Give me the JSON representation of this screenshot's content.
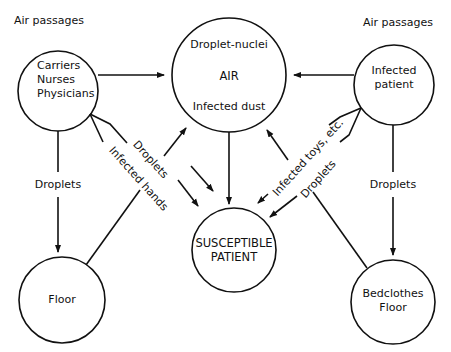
{
  "diagram": {
    "nodes": {
      "carriers": {
        "above_label": "Air passages",
        "lines": [
          "Carriers",
          "Nurses",
          "Physicians"
        ]
      },
      "air": {
        "top": "Droplet-nuclei",
        "middle": "AIR",
        "bottom": "Infected dust"
      },
      "infected_patient": {
        "above_label": "Air passages",
        "lines": [
          "Infected",
          "patient"
        ]
      },
      "susceptible": {
        "lines": [
          "SUSCEPTIBLE",
          "PATIENT"
        ]
      },
      "floor": {
        "label": "Floor"
      },
      "bedclothes": {
        "lines": [
          "Bedclothes",
          "Floor"
        ]
      }
    },
    "edges": {
      "left_down": "Droplets",
      "right_down": "Droplets",
      "left_diag_1": "Droplets",
      "left_diag_2": "Infected hands",
      "right_diag_1": "Infected toys, etc.",
      "right_diag_2": "Droplets"
    },
    "colors": {
      "line": "#111111",
      "background": "#ffffff"
    }
  }
}
